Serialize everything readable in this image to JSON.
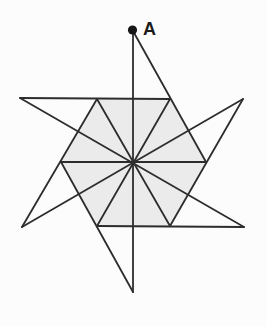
{
  "figure": {
    "type": "geometry-pinwheel-star",
    "canvas": {
      "width": 266,
      "height": 326
    },
    "colors": {
      "background": "#fcfcfc",
      "line": "#2d2d2d",
      "shaded_fill": "#ebebeb",
      "point_fill": "#161616",
      "label_color": "#1c1c1c"
    },
    "stroke_width": 1.8,
    "shaded_hexagon": {
      "name": "central-hexagon",
      "points": [
        [
          206,
          162
        ],
        [
          170,
          99
        ],
        [
          97,
          99
        ],
        [
          61,
          162
        ],
        [
          97,
          226
        ],
        [
          170,
          226
        ]
      ]
    },
    "segments": [
      {
        "name": "vertical-midline",
        "x1": 133,
        "y1": 31,
        "x2": 133,
        "y2": 292
      },
      {
        "name": "midline-upperright-lowerleft",
        "x1": 243,
        "y1": 99,
        "x2": 22,
        "y2": 227
      },
      {
        "name": "midline-upperleft-lowerright",
        "x1": 20,
        "y1": 98,
        "x2": 244,
        "y2": 227
      },
      {
        "name": "top-edge-extended",
        "x1": 20,
        "y1": 98,
        "x2": 170,
        "y2": 99
      },
      {
        "name": "bottom-edge-extended",
        "x1": 97,
        "y1": 226,
        "x2": 244,
        "y2": 227
      },
      {
        "name": "blade-a-long-side",
        "x1": 133,
        "y1": 31,
        "x2": 206,
        "y2": 162
      },
      {
        "name": "blade-upperright-long-side",
        "x1": 243,
        "y1": 99,
        "x2": 170,
        "y2": 226
      },
      {
        "name": "blade-bottom-long-side",
        "x1": 133,
        "y1": 292,
        "x2": 61,
        "y2": 162
      },
      {
        "name": "blade-lowerleft-long-side",
        "x1": 22,
        "y1": 227,
        "x2": 97,
        "y2": 99
      },
      {
        "name": "hexagon-diameter-horizontal",
        "x1": 61,
        "y1": 162,
        "x2": 206,
        "y2": 162
      },
      {
        "name": "hexagon-diameter-v3-v6",
        "x1": 97,
        "y1": 99,
        "x2": 170,
        "y2": 226
      },
      {
        "name": "hexagon-diameter-v2-v5",
        "x1": 170,
        "y1": 99,
        "x2": 97,
        "y2": 226
      }
    ],
    "point": {
      "name": "point-A",
      "x": 132.5,
      "y": 30,
      "radius": 4.6
    },
    "label": {
      "text": "A",
      "x": 143,
      "y": 35,
      "font_size": 18
    }
  }
}
